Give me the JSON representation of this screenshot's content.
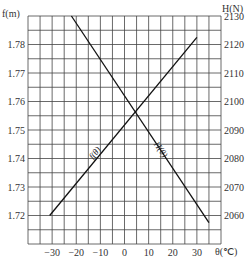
{
  "chart_data": {
    "type": "line",
    "title": "",
    "xlabel": "θ(℃)",
    "ylabel_left": "f(m)",
    "ylabel_right": "H(N)",
    "xlim": [
      -40,
      40
    ],
    "ylim_left": [
      1.71,
      1.79
    ],
    "ylim_right": [
      2050,
      2130
    ],
    "grid": true,
    "x_ticks": [
      -30,
      -20,
      -10,
      0,
      10,
      20,
      30
    ],
    "x_tick_labels": [
      "−30",
      "−20",
      "−10",
      "0",
      "10",
      "20",
      "30"
    ],
    "y_left_ticks": [
      1.72,
      1.73,
      1.74,
      1.75,
      1.76,
      1.77,
      1.78
    ],
    "y_left_tick_labels": [
      "1.72",
      "1.73",
      "1.74",
      "1.75",
      "1.76",
      "1.77",
      "1.78"
    ],
    "y_right_ticks": [
      2060,
      2070,
      2080,
      2090,
      2100,
      2110,
      2120,
      2130
    ],
    "y_right_tick_labels": [
      "2060",
      "2070",
      "2080",
      "2090",
      "2100",
      "2110",
      "2120",
      "2130"
    ],
    "series": [
      {
        "name": "f(θ)",
        "axis": "left",
        "x": [
          -31,
          30
        ],
        "values": [
          1.72,
          1.7825
        ]
      },
      {
        "name": "H(θ)",
        "axis": "right",
        "x": [
          -22,
          35
        ],
        "values": [
          2130,
          2057.5
        ]
      }
    ]
  }
}
